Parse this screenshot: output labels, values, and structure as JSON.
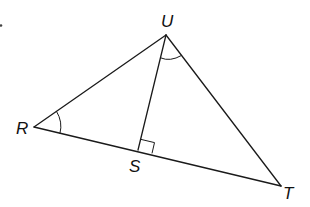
{
  "figure": {
    "type": "triangle-diagram",
    "stroke_color": "#1a1a1a",
    "background": "#ffffff",
    "vertices": {
      "U": {
        "label": "U",
        "x": 166,
        "y": 35
      },
      "R": {
        "label": "R",
        "x": 34,
        "y": 127
      },
      "S": {
        "label": "S",
        "x": 138,
        "y": 150
      },
      "T": {
        "label": "T",
        "x": 281,
        "y": 186
      }
    },
    "segments": [
      "UR",
      "UT",
      "RT",
      "US"
    ],
    "marks": {
      "angle_R": "congruent-arc",
      "angle_RUT_part": "congruent-arc at U between US and UT",
      "right_angle": "at S between US and ST"
    }
  }
}
